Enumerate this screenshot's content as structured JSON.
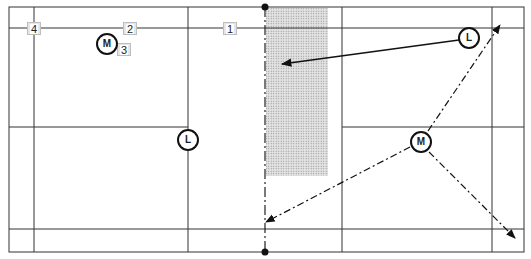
{
  "diagram": {
    "type": "badminton-court-positioning",
    "colors": {
      "line": "#333333",
      "shade": "#cfcfcf",
      "marker_stroke": "#111111"
    },
    "court": {
      "outer": {
        "x1": 9,
        "y1": 7,
        "x2": 524,
        "y2": 252
      },
      "net_x": 265,
      "verticals": [
        34,
        188,
        342,
        492
      ],
      "horizontals_full": [
        28,
        229
      ],
      "center_line_y": 127,
      "shaded_zone": {
        "x": 266,
        "y": 8,
        "w": 62,
        "h": 168
      }
    },
    "boxes": [
      {
        "label": "4",
        "x": 27,
        "y": 22
      },
      {
        "label": "2",
        "x": 123,
        "y": 22
      },
      {
        "label": "3",
        "x": 117,
        "y": 43
      },
      {
        "label": "1",
        "x": 223,
        "y": 22
      }
    ],
    "players": [
      {
        "label": "M",
        "cx": 107,
        "cy": 44
      },
      {
        "label": "L",
        "cx": 188,
        "cy": 140
      },
      {
        "label": "L",
        "cx": 469,
        "cy": 38
      },
      {
        "label": "M",
        "cx": 421,
        "cy": 142
      }
    ],
    "arrows": [
      {
        "style": "solid",
        "from": [
          459,
          40
        ],
        "to": [
          282,
          64
        ]
      },
      {
        "style": "dashed",
        "from": [
          428,
          131
        ],
        "to": [
          500,
          25
        ]
      },
      {
        "style": "dashed",
        "from": [
          410,
          147
        ],
        "to": [
          266,
          222
        ]
      },
      {
        "style": "dashed",
        "from": [
          429,
          152
        ],
        "to": [
          515,
          238
        ]
      }
    ]
  }
}
